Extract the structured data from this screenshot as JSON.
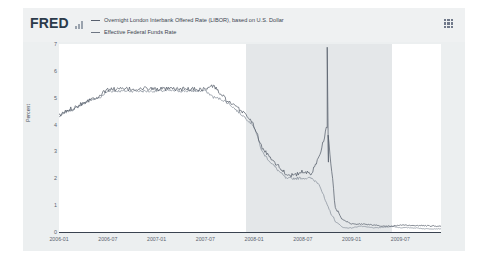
{
  "header": {
    "logo": "FRED",
    "logo_glyph_icon": "bar-chart-icon",
    "menu_icon": "grid-menu-icon"
  },
  "legend": {
    "items": [
      {
        "label": "Overnight London Interbank Offered Rate (LIBOR), based on U.S. Dollar",
        "color": "#58606e"
      },
      {
        "label": "Effective Federal Funds Rate",
        "color": "#6e7683"
      }
    ]
  },
  "chart_data": {
    "type": "line",
    "title": "",
    "xlabel": "",
    "ylabel": "Percent",
    "ylim": [
      0,
      7
    ],
    "yticks": [
      0,
      1,
      2,
      3,
      4,
      5,
      6,
      7
    ],
    "ytick_labels": [
      "0",
      "1",
      "2",
      "3",
      "4",
      "5",
      "6",
      "7"
    ],
    "xlim": [
      "2006-01",
      "2009-12"
    ],
    "xticks": [
      "2006-01",
      "2006-07",
      "2007-01",
      "2007-07",
      "2008-01",
      "2008-07",
      "2009-01",
      "2009-07"
    ],
    "grid": false,
    "legend_position": "top",
    "shaded_regions": [
      {
        "label": "recession",
        "start": "2007-12",
        "end": "2009-06",
        "color": "#e4e7e9"
      }
    ],
    "series": [
      {
        "name": "Overnight London Interbank Offered Rate (LIBOR), based on U.S. Dollar",
        "color": "#58606e",
        "x": [
          "2006-01",
          "2006-02",
          "2006-03",
          "2006-04",
          "2006-05",
          "2006-06",
          "2006-07",
          "2006-08",
          "2006-09",
          "2006-10",
          "2006-11",
          "2006-12",
          "2007-01",
          "2007-02",
          "2007-03",
          "2007-04",
          "2007-05",
          "2007-06",
          "2007-07",
          "2007-08",
          "2007-09",
          "2007-10",
          "2007-11",
          "2007-12",
          "2008-01",
          "2008-02",
          "2008-03",
          "2008-04",
          "2008-05",
          "2008-06",
          "2008-07",
          "2008-08",
          "2008-09",
          "2008-10",
          "2008-11",
          "2008-12",
          "2009-01",
          "2009-02",
          "2009-03",
          "2009-04",
          "2009-05",
          "2009-06",
          "2009-07",
          "2009-08",
          "2009-09",
          "2009-10",
          "2009-11",
          "2009-12"
        ],
        "values": [
          4.32,
          4.52,
          4.66,
          4.82,
          4.95,
          5.08,
          5.31,
          5.32,
          5.32,
          5.32,
          5.32,
          5.35,
          5.32,
          5.32,
          5.32,
          5.32,
          5.32,
          5.32,
          5.32,
          5.45,
          5.1,
          4.8,
          4.6,
          4.4,
          3.95,
          3.1,
          2.8,
          2.45,
          2.15,
          2.1,
          2.25,
          2.15,
          2.8,
          3.95,
          0.9,
          0.45,
          0.3,
          0.3,
          0.28,
          0.25,
          0.22,
          0.22,
          0.25,
          0.25,
          0.24,
          0.23,
          0.22,
          0.22
        ],
        "peak": {
          "date": "2008-10",
          "value": 6.88,
          "note": "LIBOR spike during financial crisis"
        }
      },
      {
        "name": "Effective Federal Funds Rate",
        "color": "#6e7683",
        "x": [
          "2006-01",
          "2006-02",
          "2006-03",
          "2006-04",
          "2006-05",
          "2006-06",
          "2006-07",
          "2006-08",
          "2006-09",
          "2006-10",
          "2006-11",
          "2006-12",
          "2007-01",
          "2007-02",
          "2007-03",
          "2007-04",
          "2007-05",
          "2007-06",
          "2007-07",
          "2007-08",
          "2007-09",
          "2007-10",
          "2007-11",
          "2007-12",
          "2008-01",
          "2008-02",
          "2008-03",
          "2008-04",
          "2008-05",
          "2008-06",
          "2008-07",
          "2008-08",
          "2008-09",
          "2008-10",
          "2008-11",
          "2008-12",
          "2009-01",
          "2009-02",
          "2009-03",
          "2009-04",
          "2009-05",
          "2009-06",
          "2009-07",
          "2009-08",
          "2009-09",
          "2009-10",
          "2009-11",
          "2009-12"
        ],
        "values": [
          4.29,
          4.49,
          4.59,
          4.79,
          4.94,
          4.99,
          5.24,
          5.25,
          5.25,
          5.25,
          5.25,
          5.24,
          5.25,
          5.26,
          5.26,
          5.25,
          5.25,
          5.25,
          5.26,
          5.02,
          4.94,
          4.76,
          4.49,
          4.24,
          3.94,
          2.98,
          2.61,
          2.28,
          1.98,
          2.0,
          2.01,
          2.0,
          1.81,
          0.97,
          0.39,
          0.16,
          0.15,
          0.22,
          0.18,
          0.15,
          0.18,
          0.21,
          0.16,
          0.16,
          0.15,
          0.12,
          0.12,
          0.12
        ]
      }
    ]
  }
}
